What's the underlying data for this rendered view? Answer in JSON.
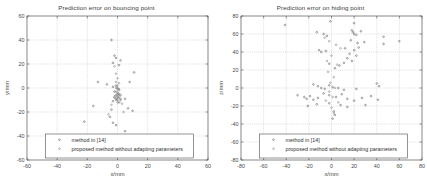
{
  "figure": {
    "panels": [
      {
        "id": "left",
        "title": "Prediction error on bouncing point",
        "xlabel": "x/mm",
        "ylabel": "y/mm",
        "xticks": [
          "-60",
          "-40",
          "-20",
          "0",
          "20",
          "40",
          "60"
        ],
        "yticks": [
          "60",
          "40",
          "20",
          "0",
          "-20",
          "-40",
          "-60"
        ],
        "legend": [
          "method in [14]",
          "proposed method without adapting parameters"
        ]
      },
      {
        "id": "right",
        "title": "Prediction error on hiding point",
        "xlabel": "x/mm",
        "ylabel": "z/mm",
        "xticks": [
          "-80",
          "-60",
          "-40",
          "-20",
          "0",
          "20",
          "40",
          "60",
          "80"
        ],
        "yticks": [
          "80",
          "60",
          "40",
          "20",
          "0",
          "-20",
          "-40",
          "-60",
          "-80"
        ],
        "legend": [
          "method in [14]",
          "proposed method without adapting parameters"
        ]
      }
    ]
  },
  "chart_data": [
    {
      "type": "scatter",
      "title": "Prediction error on bouncing point",
      "xlabel": "x/mm",
      "ylabel": "y/mm",
      "xlim": [
        -60,
        60
      ],
      "ylim": [
        -60,
        60
      ],
      "grid": true,
      "legend_position": "lower-center",
      "series": [
        {
          "name": "method in [14]",
          "marker": "dot",
          "points": [
            [
              -4,
              40
            ],
            [
              -2,
              27
            ],
            [
              -1,
              25
            ],
            [
              2,
              23
            ],
            [
              -3,
              21
            ],
            [
              1,
              19
            ],
            [
              -13,
              5
            ],
            [
              -7,
              3
            ],
            [
              -3,
              1
            ],
            [
              -1,
              2
            ],
            [
              0,
              0
            ],
            [
              1,
              -1
            ],
            [
              -2,
              -3
            ],
            [
              0,
              -4
            ],
            [
              1,
              -5
            ],
            [
              -1,
              -6
            ],
            [
              2,
              -6
            ],
            [
              0,
              -7
            ],
            [
              -2,
              -8
            ],
            [
              1,
              -8
            ],
            [
              -1,
              -9
            ],
            [
              0,
              -10
            ],
            [
              2,
              -10
            ],
            [
              -3,
              -11
            ],
            [
              1,
              -12
            ],
            [
              11,
              13
            ],
            [
              8,
              5
            ],
            [
              5,
              -9
            ],
            [
              -16,
              -15
            ],
            [
              7,
              -17
            ],
            [
              -4,
              -18
            ],
            [
              10,
              -19
            ],
            [
              -5,
              -24
            ],
            [
              -22,
              -28
            ],
            [
              -3,
              -29
            ],
            [
              -1,
              -31
            ],
            [
              5,
              -36
            ]
          ]
        },
        {
          "name": "proposed method without adapting parameters",
          "marker": "dot",
          "points": [
            [
              -2,
              18
            ],
            [
              -1,
              12
            ],
            [
              0,
              8
            ],
            [
              -1,
              5
            ],
            [
              1,
              4
            ],
            [
              0,
              2
            ],
            [
              -1,
              0
            ],
            [
              0,
              -1
            ],
            [
              1,
              -2
            ],
            [
              -1,
              -3
            ],
            [
              0,
              -5
            ],
            [
              1,
              -6
            ],
            [
              -2,
              -7
            ],
            [
              0,
              -8
            ],
            [
              2,
              -9
            ],
            [
              -1,
              -10
            ],
            [
              0,
              -12
            ],
            [
              3,
              -13
            ],
            [
              -4,
              -14
            ],
            [
              4,
              -20
            ],
            [
              -6,
              -22
            ]
          ]
        }
      ]
    },
    {
      "type": "scatter",
      "title": "Prediction error on hiding point",
      "xlabel": "x/mm",
      "ylabel": "z/mm",
      "xlim": [
        -80,
        80
      ],
      "ylim": [
        -80,
        80
      ],
      "grid": true,
      "legend_position": "lower-center",
      "series": [
        {
          "name": "method in [14]",
          "marker": "dot",
          "points": [
            [
              -41,
              70
            ],
            [
              -1,
              74
            ],
            [
              20,
              72
            ],
            [
              -13,
              62
            ],
            [
              -7,
              60
            ],
            [
              -4,
              58
            ],
            [
              18,
              64
            ],
            [
              19,
              62
            ],
            [
              20,
              60
            ],
            [
              22,
              59
            ],
            [
              26,
              63
            ],
            [
              46,
              57
            ],
            [
              17,
              53
            ],
            [
              23,
              50
            ],
            [
              29,
              51
            ],
            [
              46,
              49
            ],
            [
              60,
              52
            ],
            [
              24,
              45
            ],
            [
              -11,
              42
            ],
            [
              -9,
              40
            ],
            [
              -5,
              41
            ],
            [
              12,
              44
            ],
            [
              20,
              42
            ],
            [
              16,
              38
            ],
            [
              22,
              36
            ],
            [
              14,
              33
            ],
            [
              18,
              30
            ],
            [
              11,
              28
            ],
            [
              7,
              25
            ],
            [
              -2,
              27
            ],
            [
              3,
              22
            ],
            [
              -16,
              4
            ],
            [
              -12,
              2
            ],
            [
              -9,
              0
            ],
            [
              -6,
              -1
            ],
            [
              -2,
              3
            ],
            [
              1,
              1
            ],
            [
              6,
              0
            ],
            [
              11,
              -2
            ],
            [
              22,
              -1
            ],
            [
              42,
              2
            ],
            [
              40,
              5
            ],
            [
              -30,
              -8
            ],
            [
              -24,
              -10
            ],
            [
              -22,
              -12
            ],
            [
              -19,
              -9
            ],
            [
              -16,
              -13
            ],
            [
              -12,
              -11
            ],
            [
              -7,
              -6
            ],
            [
              -2,
              -8
            ],
            [
              4,
              -10
            ],
            [
              9,
              -7
            ],
            [
              14,
              -12
            ],
            [
              20,
              -14
            ],
            [
              27,
              -11
            ],
            [
              35,
              -9
            ],
            [
              41,
              -13
            ],
            [
              -21,
              -20
            ],
            [
              -13,
              -18
            ],
            [
              -2,
              -17
            ],
            [
              8,
              -19
            ],
            [
              14,
              -21
            ],
            [
              30,
              -19
            ],
            [
              2,
              -26
            ],
            [
              3,
              -30
            ],
            [
              1,
              -34
            ]
          ]
        },
        {
          "name": "proposed method without adapting parameters",
          "marker": "dot",
          "points": [
            [
              -6,
              56
            ],
            [
              -2,
              52
            ],
            [
              4,
              48
            ],
            [
              8,
              44
            ],
            [
              0,
              36
            ],
            [
              -4,
              30
            ],
            [
              5,
              26
            ],
            [
              -3,
              18
            ],
            [
              2,
              12
            ],
            [
              -1,
              6
            ],
            [
              3,
              0
            ],
            [
              -2,
              -4
            ],
            [
              1,
              -10
            ],
            [
              -5,
              -14
            ],
            [
              6,
              -16
            ],
            [
              0,
              -22
            ],
            [
              2,
              -28
            ]
          ]
        }
      ]
    }
  ]
}
